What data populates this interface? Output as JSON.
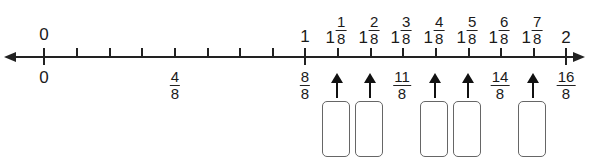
{
  "number_line": {
    "range": [
      0,
      2
    ],
    "denominator": 8,
    "direction": "both-arrows",
    "top_labels": {
      "zero": "0",
      "one": "1",
      "two": "2",
      "mixed": [
        {
          "whole": "1",
          "num": "1",
          "den": "8"
        },
        {
          "whole": "1",
          "num": "2",
          "den": "8"
        },
        {
          "whole": "1",
          "num": "3",
          "den": "8"
        },
        {
          "whole": "1",
          "num": "4",
          "den": "8"
        },
        {
          "whole": "1",
          "num": "5",
          "den": "8"
        },
        {
          "whole": "1",
          "num": "6",
          "den": "8"
        },
        {
          "whole": "1",
          "num": "7",
          "den": "8"
        }
      ]
    },
    "bottom_labels": {
      "zero": "0",
      "fractions": [
        {
          "position": "4/8",
          "num": "4",
          "den": "8"
        },
        {
          "position": "8/8",
          "num": "8",
          "den": "8"
        },
        {
          "position": "11/8",
          "num": "11",
          "den": "8"
        },
        {
          "position": "14/8",
          "num": "14",
          "den": "8"
        },
        {
          "position": "16/8",
          "num": "16",
          "den": "8"
        }
      ]
    },
    "answer_boxes": [
      {
        "points_to": "9/8",
        "value": ""
      },
      {
        "points_to": "10/8",
        "value": ""
      },
      {
        "points_to": "12/8",
        "value": ""
      },
      {
        "points_to": "13/8",
        "value": ""
      },
      {
        "points_to": "15/8",
        "value": ""
      }
    ]
  }
}
